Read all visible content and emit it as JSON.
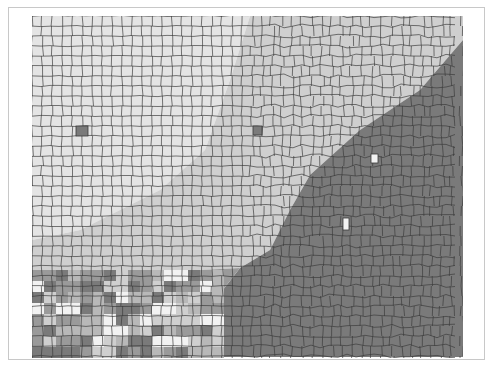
{
  "map": {
    "type": "choropleth",
    "subject": "US counties (central and southeastern United States)",
    "frame": {
      "x": 8,
      "y": 7,
      "width": 477,
      "height": 353,
      "border_color": "#c8c8c8"
    },
    "extent": {
      "x": 32,
      "y": 16,
      "width": 431,
      "height": 342
    },
    "boundary_color": "#3a3a3a",
    "legend": null,
    "title": null,
    "classes": [
      {
        "id": "c1",
        "color": "#e4e4e4",
        "description": "lightest (northwest plains)"
      },
      {
        "id": "c2",
        "color": "#cfcfcf",
        "description": "light gray (midwest)"
      },
      {
        "id": "c3",
        "color": "#b8b8b8",
        "description": "medium-light gray"
      },
      {
        "id": "c4",
        "color": "#9a9a9a",
        "description": "medium gray"
      },
      {
        "id": "c5",
        "color": "#7a7a7a",
        "description": "dark gray (southeast)"
      },
      {
        "id": "c6",
        "color": "#f2f2f2",
        "description": "near white outliers"
      }
    ],
    "regions": [
      {
        "name": "northwest-plains",
        "class": "c1",
        "polygon": "32,16 250,16 230,80 205,150 160,190 120,210 80,230 32,240"
      },
      {
        "name": "midwest-band",
        "class": "c2",
        "polygon": "250,16 463,16 463,40 420,90 360,130 310,175 290,210 270,250 240,268 200,270 32,270 32,240 80,230 120,210 160,190 205,150 230,80"
      },
      {
        "name": "southeast",
        "class": "c5",
        "polygon": "463,40 463,357 215,357 215,300 240,268 270,250 290,210 310,175 360,130 420,90"
      },
      {
        "name": "south-plains-mixed",
        "class": "c4",
        "polygon": "32,270 200,270 240,268 215,300 215,357 32,357"
      }
    ],
    "highlighted_counties": [
      {
        "x": 76,
        "y": 126,
        "w": 12,
        "h": 10,
        "class": "c5"
      },
      {
        "x": 253,
        "y": 126,
        "w": 9,
        "h": 9,
        "class": "c5"
      },
      {
        "x": 371,
        "y": 154,
        "w": 7,
        "h": 9,
        "class": "c6"
      },
      {
        "x": 343,
        "y": 218,
        "w": 6,
        "h": 12,
        "class": "c6"
      }
    ]
  }
}
